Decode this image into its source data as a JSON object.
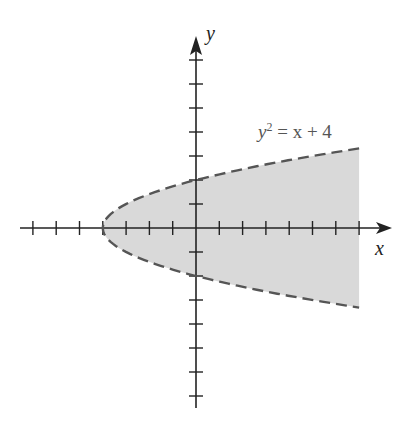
{
  "chart_data": {
    "type": "area",
    "title": "",
    "equation_label": "y² = x + 4",
    "equation_parts": {
      "y": "y",
      "exp": "2",
      "rest": " = x + 4"
    },
    "xlabel": "x",
    "ylabel": "y",
    "boundary": {
      "equation": "y^2 = x + 4",
      "style": "dashed",
      "vertex": [
        -4,
        0
      ],
      "y_intercepts": [
        2,
        -2
      ]
    },
    "shaded_region": "x > y^2 - 4 (inside parabola), shown for x from -4 to 7",
    "xlim": [
      -7.5,
      8.5
    ],
    "ylim": [
      -7.5,
      7.5
    ],
    "x_ticks": [
      -7,
      -6,
      -5,
      -4,
      -3,
      -2,
      -1,
      1,
      2,
      3,
      4,
      5,
      6,
      7
    ],
    "y_ticks": [
      -7,
      -6,
      -5,
      -4,
      -3,
      -2,
      -1,
      1,
      2,
      3,
      4,
      5,
      6,
      7
    ],
    "grid": false,
    "colors": {
      "axis": "#222222",
      "curve": "#555555",
      "fill": "#d9d9d9"
    }
  }
}
